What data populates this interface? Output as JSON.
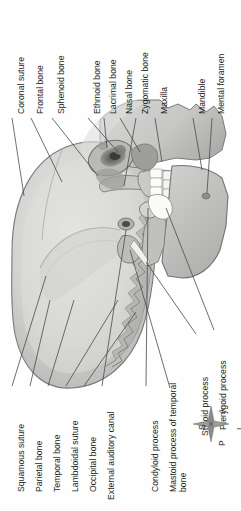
{
  "figure": {
    "orientation": "rotated-90-ccw"
  },
  "labels_top": [
    {
      "id": "coronal-suture",
      "text": "Coronal suture"
    },
    {
      "id": "frontal-bone",
      "text": "Frontal bone"
    },
    {
      "id": "sphenoid-bone",
      "text": "Sphenoid bone"
    },
    {
      "id": "ethmoid-bone",
      "text": "Ethmoid bone"
    },
    {
      "id": "lacrimal-bone",
      "text": "Lacrimal bone"
    },
    {
      "id": "nasal-bone",
      "text": "Nasal bone"
    },
    {
      "id": "zygomatic-bone",
      "text": "Zygomatic bone"
    },
    {
      "id": "maxilla",
      "text": "Maxilla"
    },
    {
      "id": "mandible",
      "text": "Mandible"
    },
    {
      "id": "mental-foramen",
      "text": "Mental foramen"
    }
  ],
  "labels_bottom_left": [
    {
      "id": "squamous-suture",
      "text": "Squamous suture"
    },
    {
      "id": "parietal-bone",
      "text": "Parietal bone"
    },
    {
      "id": "temporal-bone",
      "text": "Temporal bone"
    },
    {
      "id": "lambdoidal-suture",
      "text": "Lambdoidal suture"
    },
    {
      "id": "occipital-bone",
      "text": "Occipital bone"
    },
    {
      "id": "external-auditory-canal",
      "text": "External auditory canal"
    }
  ],
  "labels_bottom_right": [
    {
      "id": "condyloid-process",
      "text": "Condyloid process"
    },
    {
      "id": "mastoid-process",
      "text": "Mastoid process of temporal bone"
    },
    {
      "id": "styloid-process",
      "text": "Styloid process"
    },
    {
      "id": "pterygoid-process",
      "text": "Pterygoid process"
    }
  ],
  "compass": {
    "anterior": "A",
    "posterior": "P",
    "superior": "S",
    "inferior": "I"
  },
  "colors": {
    "background": "#fefefe",
    "bone_light": "#dcdcda",
    "bone_mid": "#c3c3c1",
    "bone_dark": "#a3a3a1",
    "bone_shadow": "#8a8a88",
    "teeth": "#fbfbf9",
    "outline": "#6b6b69",
    "leader_line": "#4a4a4a",
    "text": "#1d1d1d"
  }
}
